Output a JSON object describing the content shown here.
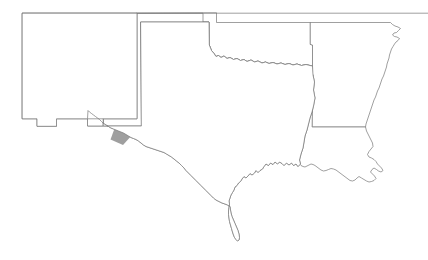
{
  "map": {
    "title": "Southwestern United States county highlight map",
    "background_color": "#ffffff",
    "outline_color": "#777777",
    "highlight_color": "#9f9f9f",
    "outline_width": 0.7,
    "canvas": {
      "width": 428,
      "height": 260
    },
    "legend": {
      "visible": false,
      "entries": []
    },
    "labels": {
      "visible": false,
      "entries": []
    },
    "states": [
      {
        "name": "new-mexico",
        "label": "New Mexico",
        "highlighted": false,
        "path": "M 22.5 13.2 L 137.0 13.2 L 137.0 118.8 L 103.2 118.8 L 103.2 126.0 L 87.5 126.0 L 87.5 118.8 L 56.5 118.8 L 56.5 126.3 L 37.0 126.3 L 37.0 118.8 L 22.5 118.8 Z"
      },
      {
        "name": "oklahoma",
        "label": "Oklahoma",
        "highlighted": false,
        "path": "M 137.0 13.2 L 203.0 13.2 L 203.0 22.0 L 209.0 22.0 L 209.3 45.0 L 211.5 50.5 L 214.0 53.5 L 216.0 56.5 L 218.5 55.5 L 221.0 57.5 L 224.0 56.0 L 227.0 58.5 L 230.0 57.5 L 233.5 59.5 L 237.0 58.5 L 240.5 60.5 L 244.0 59.5 L 247.0 61.5 L 251.0 60.0 L 254.5 62.0 L 258.0 61.0 L 262.0 63.0 L 265.5 62.0 L 269.0 63.5 L 273.0 62.5 L 277.0 64.0 L 281.0 63.0 L 285.0 64.5 L 289.0 63.5 L 293.0 65.0 L 297.0 64.0 L 301.5 65.5 L 306.0 64.5 L 310.0 65.5 L 312.5 66.0 L 312.5 45.0 L 310.5 44.5 L 310.5 22.5 L 216.5 22.5 L 216.5 13.2 Z"
      },
      {
        "name": "texas",
        "label": "Texas",
        "highlighted": false,
        "path": "M 141.0 22.0 L 203.0 22.0 L 209.0 22.0 L 209.3 45.0 L 211.5 50.5 L 214.0 53.5 L 216.0 56.5 L 218.5 55.5 L 221.0 57.5 L 224.0 56.0 L 227.0 58.5 L 230.0 57.5 L 233.5 59.5 L 237.0 58.5 L 240.5 60.5 L 244.0 59.5 L 247.0 61.5 L 251.0 60.0 L 254.5 62.0 L 258.0 61.0 L 262.0 63.0 L 265.5 62.0 L 269.0 63.5 L 273.0 62.5 L 277.0 64.0 L 281.0 63.0 L 285.0 64.5 L 289.0 63.5 L 293.0 65.0 L 297.0 64.0 L 301.5 65.5 L 306.0 64.5 L 310.0 65.5 L 312.5 66.0 L 313.0 75.0 L 314.5 82.0 L 313.5 90.0 L 315.0 98.0 L 313.5 106.0 L 312.0 112.0 L 310.0 118.0 L 308.5 124.0 L 307.0 130.0 L 305.0 136.0 L 304.0 142.0 L 303.0 148.0 L 301.0 154.0 L 299.5 160.0 L 300.5 164.0 L 298.0 166.5 L 296.0 164.0 L 293.5 165.5 L 291.5 163.0 L 289.0 165.0 L 286.5 163.0 L 284.0 165.5 L 282.0 163.5 L 279.5 162.0 L 277.5 164.0 L 275.0 162.0 L 273.0 164.5 L 270.5 163.0 L 268.5 165.5 L 266.0 164.0 L 264.0 166.5 L 262.5 169.0 L 260.0 170.5 L 258.0 172.5 L 256.0 170.5 L 254.5 173.0 L 252.0 175.0 L 250.0 173.5 L 248.0 176.0 L 246.0 178.0 L 244.0 176.5 L 242.0 179.0 L 240.5 181.5 L 238.5 183.0 L 237.0 185.5 L 235.0 187.0 L 234.0 190.0 L 232.5 192.5 L 231.0 195.0 L 230.0 198.0 L 229.0 201.0 L 229.5 204.0 L 229.0 207.5 L 228.5 211.0 L 228.5 214.5 L 229.0 218.0 L 229.5 221.5 L 230.5 225.0 L 231.5 228.5 L 232.5 232.0 L 233.5 235.0 L 234.5 237.5 L 236.0 239.5 L 237.5 241.0 L 239.0 240.0 L 239.5 237.5 L 239.0 234.0 L 238.0 230.5 L 236.5 227.0 L 235.0 223.5 L 233.5 220.0 L 232.0 216.5 L 231.0 213.0 L 230.5 210.0 L 230.0 206.5 L 227.5 205.0 L 225.0 204.0 L 222.0 203.0 L 219.0 201.5 L 216.0 200.0 L 213.5 198.0 L 211.0 195.5 L 208.5 193.0 L 206.0 190.5 L 203.5 188.0 L 201.0 185.5 L 198.5 183.0 L 196.0 180.5 L 193.5 178.0 L 191.0 175.5 L 188.5 173.0 L 186.0 170.5 L 184.0 168.0 L 181.5 165.5 L 179.0 163.0 L 176.5 161.0 L 174.0 159.0 L 171.5 157.0 L 169.0 155.5 L 166.5 154.0 L 164.0 152.5 L 161.0 151.5 L 158.0 150.5 L 155.0 149.5 L 152.0 148.5 L 149.0 147.5 L 146.0 146.5 L 143.5 145.0 L 141.0 143.0 L 138.5 141.0 L 136.0 139.5 L 133.5 138.5 L 131.0 137.5 L 128.5 136.0 L 126.0 134.5 L 123.5 133.0 L 121.0 132.0 L 118.5 131.0 L 116.0 130.0 L 113.5 129.0 L 111.0 128.0 L 108.5 126.5 L 106.0 125.0 L 103.5 123.5 L 101.5 121.5 L 99.5 119.5 L 97.5 118.0 L 95.5 116.5 L 93.5 115.0 L 91.5 113.5 L 89.5 112.0 L 88.0 110.5 L 87.5 118.8 L 103.2 118.8 L 103.2 126.0 L 141.0 126.0 Z"
      },
      {
        "name": "kansas-colorado-edge",
        "label": "Northern border",
        "highlighted": false,
        "path": "M 22.5 13.2 L 428.0 13.2"
      },
      {
        "name": "arkansas",
        "label": "Arkansas",
        "highlighted": false,
        "path": "M 310.5 22.5 L 390.5 22.5 L 392.5 24.5 L 395.0 26.0 L 398.0 27.0 L 400.5 28.5 L 398.5 30.5 L 396.5 32.5 L 394.0 33.0 L 392.5 35.0 L 394.5 36.5 L 397.0 37.0 L 399.5 38.5 L 398.0 40.5 L 396.0 42.0 L 394.5 44.0 L 393.0 46.5 L 391.5 49.0 L 390.5 52.0 L 389.5 55.0 L 389.0 58.0 L 388.0 61.0 L 387.0 64.0 L 386.5 67.0 L 385.5 70.0 L 384.5 73.0 L 383.5 76.0 L 382.0 79.0 L 381.0 82.0 L 380.0 85.0 L 379.0 88.0 L 377.5 91.0 L 376.5 94.0 L 375.5 97.0 L 374.0 100.0 L 373.0 103.0 L 372.0 106.0 L 371.0 109.0 L 370.0 112.0 L 369.0 115.0 L 368.0 118.0 L 367.0 121.0 L 366.0 124.0 L 365.5 127.0 L 312.5 127.0 L 312.5 66.0 L 312.5 45.0 L 310.5 44.5 Z"
      },
      {
        "name": "louisiana",
        "label": "Louisiana",
        "highlighted": false,
        "path": "M 312.5 127.0 L 365.5 127.0 L 366.5 131.0 L 368.0 134.0 L 369.5 137.0 L 371.0 140.0 L 372.5 143.0 L 373.0 146.5 L 371.0 149.0 L 369.0 151.5 L 367.5 154.5 L 369.0 157.0 L 371.5 158.0 L 374.0 159.5 L 376.0 161.5 L 377.5 164.0 L 379.5 166.0 L 381.5 168.0 L 383.0 170.5 L 381.0 172.0 L 378.5 171.0 L 376.5 169.5 L 374.0 168.0 L 372.0 169.5 L 370.5 172.0 L 372.5 174.0 L 374.5 176.0 L 376.0 178.5 L 374.0 180.5 L 371.5 181.5 L 369.0 182.0 L 366.5 181.0 L 364.0 179.5 L 361.5 178.0 L 359.0 176.5 L 357.0 178.0 L 355.0 180.0 L 352.5 181.0 L 350.0 180.5 L 348.0 179.0 L 346.0 177.5 L 344.0 176.0 L 342.0 174.5 L 340.0 173.0 L 338.0 171.5 L 336.0 170.0 L 333.5 169.0 L 331.0 168.5 L 328.5 169.5 L 326.0 170.5 L 323.5 171.0 L 321.0 170.0 L 319.0 168.5 L 317.0 167.0 L 315.0 165.5 L 313.0 164.5 L 311.0 164.0 L 309.0 165.0 L 307.0 166.0 L 305.0 167.0 L 303.0 166.5 L 301.0 165.5 L 299.5 164.0 L 300.5 164.0 L 299.5 160.0 L 301.0 154.0 L 303.0 148.0 L 304.0 142.0 L 305.0 136.0 L 307.0 130.0 L 308.5 124.0 L 310.0 118.0 L 312.0 112.0 L 313.5 106.0 L 315.0 98.0 L 313.5 90.0 L 314.5 82.0 L 313.0 75.0 Z"
      }
    ],
    "highlighted_counties": [
      {
        "name": "county-nw-large",
        "region": "new-mexico-northwest",
        "path": "M 55.5 15.5 L 84.0 15.5 L 84.0 24.0 L 93.0 24.0 L 93.0 25.5 L 88.0 28.0 L 82.0 27.5 L 80.5 24.0 L 75.0 24.0 L 75.0 33.0 L 77.0 36.0 L 77.0 44.5 L 65.0 44.5 L 65.0 39.0 L 62.0 36.5 L 62.0 26.0 L 55.5 26.0 Z"
      },
      {
        "name": "county-central-west",
        "region": "new-mexico-west-central",
        "path": "M 53.0 58.5 L 66.0 58.5 L 66.0 61.5 L 79.0 61.5 L 79.0 73.5 L 83.0 73.5 L 83.0 84.0 L 57.0 84.0 L 57.0 79.0 L 53.0 79.0 Z"
      },
      {
        "name": "county-central-south",
        "region": "new-mexico-south-central",
        "path": "M 78.0 85.5 L 92.0 85.5 L 92.0 82.0 L 101.0 82.0 L 101.0 93.0 L 101.5 107.5 L 78.0 107.5 Z"
      },
      {
        "name": "county-east-central",
        "region": "new-mexico-east-central",
        "path": "M 101.5 67.5 L 109.0 67.5 L 109.0 70.0 L 117.5 70.0 L 117.5 80.0 L 122.5 80.0 L 122.5 83.5 L 126.0 83.5 L 126.0 85.5 L 122.0 85.5 L 122.0 90.5 L 101.0 90.5 L 101.0 82.0 Z"
      },
      {
        "name": "county-southwest-boot",
        "region": "new-mexico-southwest",
        "path": "M 25.5 95.5 L 33.5 92.5 L 44.0 92.5 L 48.0 95.5 L 48.0 101.0 L 41.0 101.0 L 41.0 103.0 L 38.0 103.0 L 38.5 118.0 L 34.0 118.0 L 34.0 103.0 L 29.0 103.0 L 25.5 100.0 Z"
      },
      {
        "name": "county-west-texas",
        "region": "west-texas-diamond",
        "path": "M 114.0 130.0 L 126.5 127.5 L 133.0 134.0 L 123.0 145.0 L 110.5 139.5 Z"
      }
    ]
  }
}
